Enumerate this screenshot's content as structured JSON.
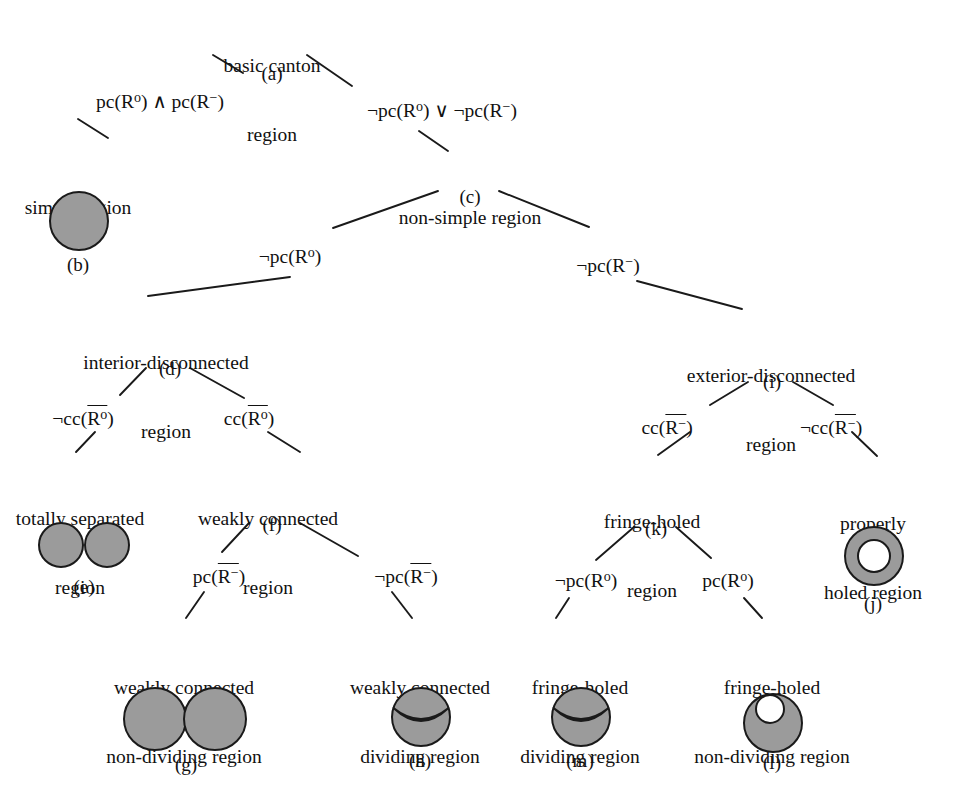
{
  "diagram": {
    "type": "tree-classification-diagram",
    "fill_color": "#9b9b9b",
    "stroke_color": "#1a1a1a",
    "background": "#ffffff"
  },
  "nodes": [
    {
      "id": "a",
      "label_line1": "basic canton",
      "label_line2": "region",
      "tag": "(a)",
      "x": 272,
      "y": 10
    },
    {
      "id": "b",
      "label_line1": "simple region",
      "label_line2": "",
      "tag": "(b)",
      "x": 78,
      "y": 152
    },
    {
      "id": "c",
      "label_line1": "non-simple region",
      "label_line2": "",
      "tag": "(c)",
      "x": 470,
      "y": 162
    },
    {
      "id": "d",
      "label_line1": "interior-disconnected",
      "label_line2": "region",
      "tag": "(d)",
      "x": 166,
      "y": 307
    },
    {
      "id": "i",
      "label_line1": "exterior-disconnected",
      "label_line2": "region",
      "tag": "(i)",
      "x": 771,
      "y": 320
    },
    {
      "id": "e",
      "label_line1": "totally separated",
      "label_line2": "region",
      "tag": "(e)",
      "x": 80,
      "y": 463
    },
    {
      "id": "f",
      "label_line1": "weakly connected",
      "label_line2": "region",
      "tag": "(f)",
      "x": 268,
      "y": 463
    },
    {
      "id": "k",
      "label_line1": "fringe-holed",
      "label_line2": "region",
      "tag": "(k)",
      "x": 652,
      "y": 466
    },
    {
      "id": "j",
      "label_line1": "properly",
      "label_line2": "holed region",
      "tag": "(j)",
      "x": 873,
      "y": 468
    },
    {
      "id": "g",
      "label_line1": "weakly connected",
      "label_line2": "non-diving region",
      "tag": "(g)",
      "x": 184,
      "y": 632
    },
    {
      "id": "h",
      "label_line1": "weakly connected",
      "label_line2": "dividing region",
      "tag": "(h)",
      "x": 420,
      "y": 632
    },
    {
      "id": "m",
      "label_line1": "fringe-holed",
      "label_line2": "dividing region",
      "tag": "(m)",
      "x": 580,
      "y": 632
    },
    {
      "id": "l",
      "label_line1": "fringe-holed",
      "label_line2": "non-dividing region",
      "tag": "(l)",
      "x": 772,
      "y": 632
    }
  ],
  "node_labels": {
    "a1": "basic canton",
    "a2": "region",
    "a_tag": "(a)",
    "b1": "simple region",
    "b_tag": "(b)",
    "c1": "non-simple region",
    "c_tag": "(c)",
    "d1": "interior-disconnected",
    "d2": "region",
    "d_tag": "(d)",
    "i1": "exterior-disconnected",
    "i2": "region",
    "i_tag": "(i)",
    "e1": "totally separated",
    "e2": "region",
    "e_tag": "(e)",
    "f1": "weakly connected",
    "f2": "region",
    "f_tag": "(f)",
    "k1": "fringe-holed",
    "k2": "region",
    "k_tag": "(k)",
    "j1": "properly",
    "j2": "holed region",
    "j_tag": "(j)",
    "g1": "weakly connected",
    "g2": "non-dividing region",
    "g_tag": "(g)",
    "h1": "weakly connected",
    "h2": "dividing region",
    "h_tag": "(h)",
    "m1": "fringe-holed",
    "m2": "dividing region",
    "m_tag": "(m)",
    "l1": "fringe-holed",
    "l2": "non-dividing region",
    "l_tag": "(l)"
  },
  "edge_labels": {
    "e1": "pc(Rº) ∧ pc(R⁻)",
    "e2": "¬pc(Rº) ∨ ¬pc(R⁻)",
    "e3": "¬pc(Rº)",
    "e4": "¬pc(R⁻)",
    "e5": "¬cc(Rº̅)",
    "e6": "cc(Rº̅)",
    "e7": "cc(R⁻̅)",
    "e8": "¬cc(R⁻̅)",
    "e9": "pc(R⁻̅)",
    "e10": "¬pc(R⁻̅)",
    "e11": "¬pc(Rº)",
    "e12": "pc(Rº)"
  },
  "edges": [
    {
      "from": "a",
      "to": "b",
      "condition": "pc(Rº) ∧ pc(R⁻)"
    },
    {
      "from": "a",
      "to": "c",
      "condition": "¬pc(Rº) ∨ ¬pc(R⁻)"
    },
    {
      "from": "c",
      "to": "d",
      "condition": "¬pc(Rº)"
    },
    {
      "from": "c",
      "to": "i",
      "condition": "¬pc(R⁻)"
    },
    {
      "from": "d",
      "to": "e",
      "condition": "¬cc(Rº̅)"
    },
    {
      "from": "d",
      "to": "f",
      "condition": "cc(Rº̅)"
    },
    {
      "from": "i",
      "to": "k",
      "condition": "cc(R⁻̅)"
    },
    {
      "from": "i",
      "to": "j",
      "condition": "¬cc(R⁻̅)"
    },
    {
      "from": "f",
      "to": "g",
      "condition": "pc(R⁻̅)"
    },
    {
      "from": "f",
      "to": "h",
      "condition": "¬pc(R⁻̅)"
    },
    {
      "from": "k",
      "to": "m",
      "condition": "¬pc(Rº)"
    },
    {
      "from": "k",
      "to": "l",
      "condition": "pc(Rº)"
    }
  ],
  "shapes": [
    {
      "id": "b",
      "kind": "single-disc"
    },
    {
      "id": "e",
      "kind": "two-separate-discs"
    },
    {
      "id": "g",
      "kind": "two-tangent-discs"
    },
    {
      "id": "h",
      "kind": "disc-with-lens-slit"
    },
    {
      "id": "m",
      "kind": "disc-with-lens-slit"
    },
    {
      "id": "l",
      "kind": "disc-with-boundary-touching-hole"
    },
    {
      "id": "j",
      "kind": "annulus"
    }
  ]
}
